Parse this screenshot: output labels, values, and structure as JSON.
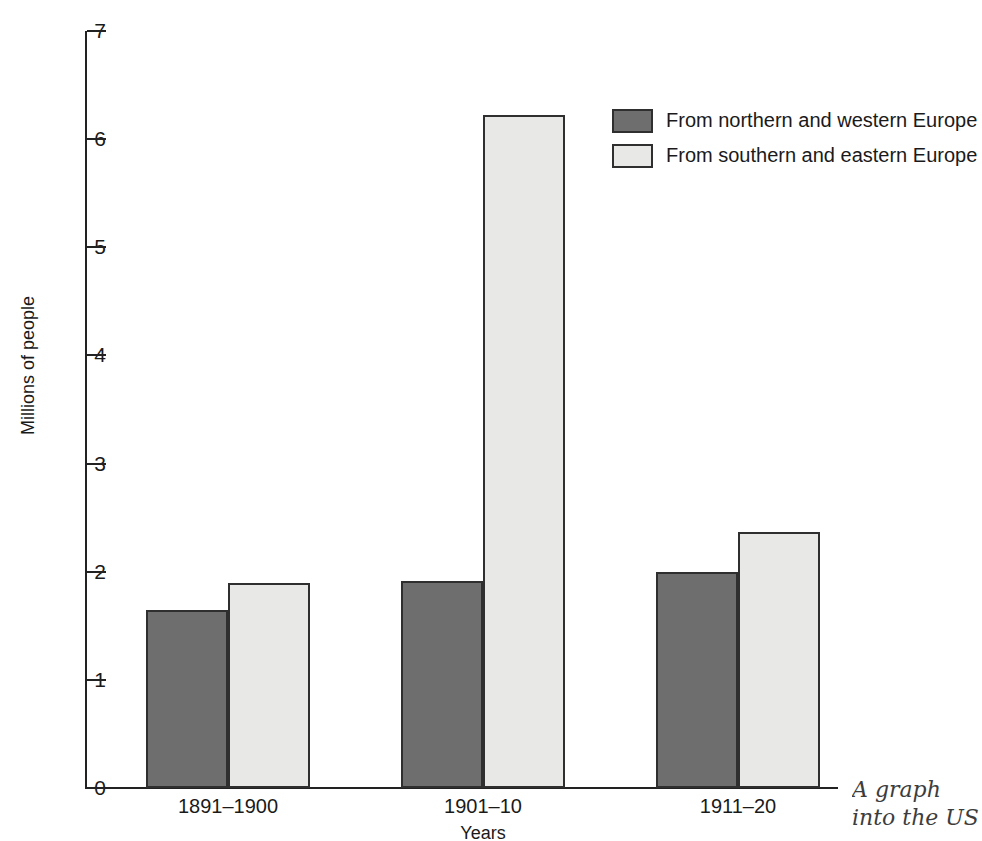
{
  "chart_data": {
    "type": "bar",
    "title": "",
    "xlabel": "Years",
    "ylabel": "Millions of people",
    "categories": [
      "1891–1900",
      "1901–10",
      "1911–20"
    ],
    "series": [
      {
        "name": "From northern and western Europe",
        "color": "#6e6e6e",
        "values": [
          1.65,
          1.91,
          2.0
        ]
      },
      {
        "name": "From southern and eastern Europe",
        "color": "#e8e8e6",
        "values": [
          1.9,
          6.22,
          2.37
        ]
      }
    ],
    "ylim": [
      0,
      7
    ],
    "yticks": [
      "0",
      "1",
      "2",
      "3",
      "4",
      "5",
      "6",
      "7"
    ],
    "grid": false,
    "legend_position": "top-right"
  },
  "axes": {
    "y_title": "Millions of people",
    "x_title": "Years"
  },
  "legend": {
    "entries": [
      {
        "label": "From northern and western Europe",
        "swatch": "dark"
      },
      {
        "label": "From southern and eastern Europe",
        "swatch": "light"
      }
    ]
  },
  "caption": {
    "line1": "A graph",
    "line2": "into the US"
  }
}
